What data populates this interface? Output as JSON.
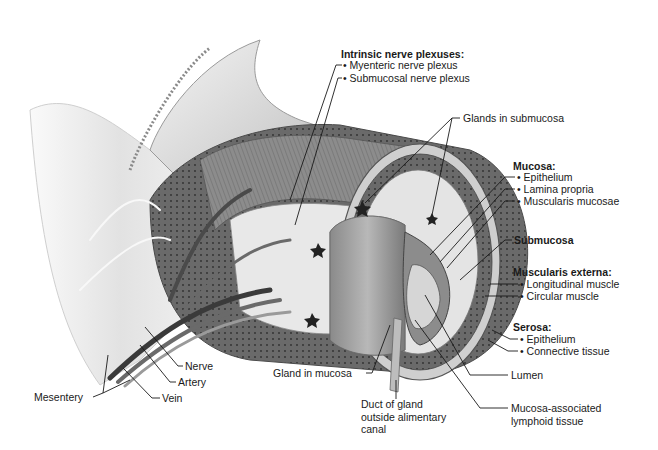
{
  "diagram": {
    "labels": {
      "intrinsic_nerve_plexuses": {
        "heading": "Intrinsic nerve plexuses:",
        "items": [
          "• Myenteric nerve plexus",
          "• Submucosal nerve plexus"
        ]
      },
      "glands_in_submucosa": "Glands in submucosa",
      "mucosa": {
        "heading": "Mucosa:",
        "items": [
          "• Epithelium",
          "• Lamina propria",
          "• Muscularis mucosae"
        ]
      },
      "submucosa": "Submucosa",
      "muscularis_externa": {
        "heading": "Muscularis externa:",
        "items": [
          "• Longitudinal muscle",
          "• Circular muscle"
        ]
      },
      "serosa": {
        "heading": "Serosa:",
        "items": [
          "• Epithelium",
          "• Connective tissue"
        ]
      },
      "lumen": "Lumen",
      "malt": "Mucosa-associated\nlymphoid tissue",
      "duct_of_gland": "Duct of gland\noutside alimentary\ncanal",
      "gland_in_mucosa": "Gland in mucosa",
      "nerve": "Nerve",
      "artery": "Artery",
      "vein": "Vein",
      "mesentery": "Mesentery"
    },
    "colors": {
      "line": "#1a1a1a",
      "tissue_light": "#e6e6e6",
      "tissue_mid": "#a8a8a8",
      "tissue_dark": "#5a5a5a"
    }
  }
}
